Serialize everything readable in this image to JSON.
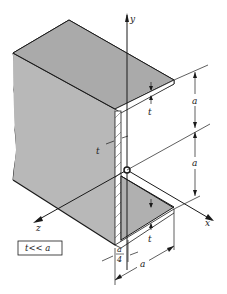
{
  "figure": {
    "colors": {
      "fill": "#b4b4b4",
      "line": "#1a1a1a",
      "background": "#ffffff"
    },
    "axes": {
      "x": "x",
      "y": "y",
      "z": "z"
    },
    "dimensions": {
      "top_flange_thickness": "t",
      "web_thickness": "t",
      "bottom_flange_thickness": "t",
      "upper_height": "a",
      "lower_height": "a",
      "flange_width": "a",
      "offset_num": "a",
      "offset_den": "4"
    },
    "condition_box": "t<< a"
  }
}
